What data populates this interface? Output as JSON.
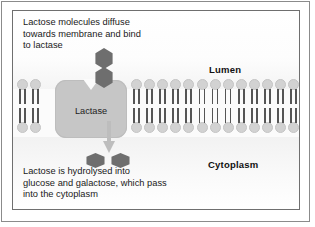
{
  "figure": {
    "captions": {
      "top": "Lactose molecules diffuse\ntowards membrane and bind\nto lactase",
      "bottom": "Lactose is hydrolysed into\nglucose and galactose, which pass\ninto the cytoplasm"
    },
    "regions": {
      "lumen_label": "Lumen",
      "cytoplasm_label": "Cytoplasm"
    },
    "protein": {
      "label": "Lactase"
    },
    "molecules": {
      "substrate_name": "lactose",
      "substrate_subunits": 2,
      "product_1": "glucose",
      "product_2": "galactose"
    },
    "membrane": {
      "type": "phospholipid bilayer",
      "lipids_left": 2,
      "lipids_right": 13,
      "tails_per_lipid": 2
    },
    "colors": {
      "sugar": "#6e6e6e",
      "protein": "#c6c6c6",
      "lipid_head": "#d2d2d2",
      "lipid_tail": "#555555",
      "arrow": "#bdbdbd",
      "text": "#1a1a1a",
      "frame": "#6f6f6f"
    }
  }
}
